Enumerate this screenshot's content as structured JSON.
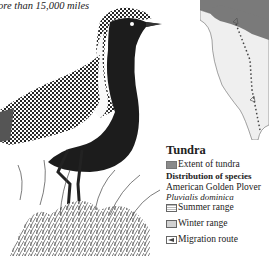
{
  "caption": "ore than 15,000 miles",
  "illustration": {
    "subject": "American Golden Plover standing in tundra grass",
    "icon": "bird-illustration"
  },
  "map": {
    "icon": "north-america-map",
    "colors": {
      "tundra": "#7a7a7a",
      "land": "#efefef",
      "water": "#ffffff"
    }
  },
  "legend": {
    "title": "Tundra",
    "items": [
      {
        "label": "Extent of tundra",
        "swatch": "tundra"
      }
    ],
    "distribution_heading": "Distribution of species",
    "species_common": "American Golden Plover",
    "species_scientific": "Pluvialis dominica",
    "ranges": [
      {
        "label": "Summer range",
        "swatch": "summer"
      },
      {
        "label": "Winter range",
        "swatch": "winter"
      },
      {
        "label": "Migration route",
        "swatch": "route"
      }
    ]
  }
}
